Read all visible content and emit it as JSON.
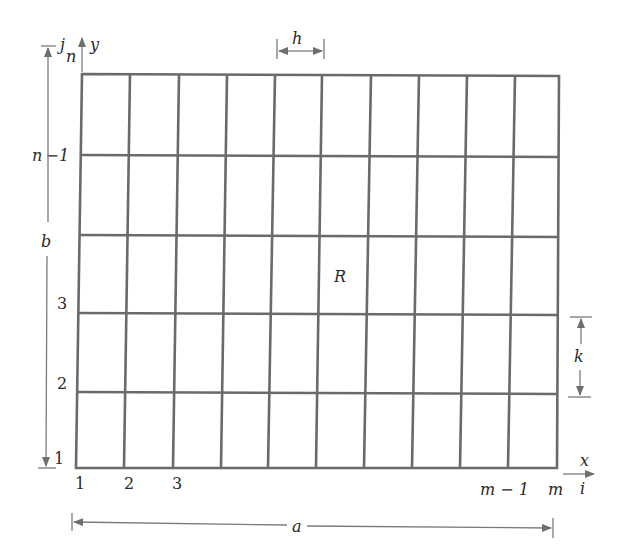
{
  "diagram": {
    "region_label": "R",
    "grid": {
      "columns": 10,
      "rows": 5,
      "left": 78,
      "right": 558,
      "top": 74,
      "bottom": 469
    },
    "axes": {
      "vertical_index_label": "j",
      "vertical_axis_label": "y",
      "horizontal_axis_label": "x",
      "horizontal_index_label": "i"
    },
    "row_labels": [
      "n",
      "n −1",
      "3",
      "2",
      "1"
    ],
    "column_labels": [
      "1",
      "2",
      "3",
      "m − 1",
      "m"
    ],
    "dimensions": {
      "width_label": "a",
      "height_label": "b",
      "cell_width_label": "h",
      "cell_height_label": "k"
    }
  }
}
